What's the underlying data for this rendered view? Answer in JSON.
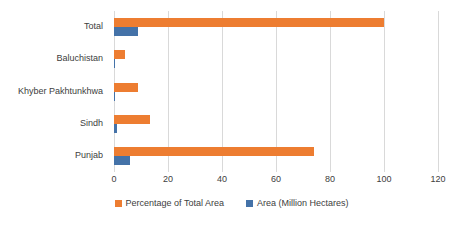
{
  "chart_data": {
    "type": "bar",
    "orientation": "horizontal",
    "title": "",
    "xlabel": "",
    "ylabel": "",
    "categories": [
      "Total",
      "Baluchistan",
      "Khyber Pakhtunkhwa",
      "Sindh",
      "Punjab"
    ],
    "series": [
      {
        "name": "Percentage of Total Area",
        "color": "#ED7D31",
        "values": [
          100,
          4,
          9,
          13.5,
          74
        ]
      },
      {
        "name": "Area (Million Hectares)",
        "color": "#4472A8",
        "values": [
          8.8,
          0.2,
          0.5,
          1,
          6
        ]
      }
    ],
    "xlim": [
      0,
      120
    ],
    "xticks": [
      0,
      20,
      40,
      60,
      80,
      100,
      120
    ],
    "xtick_labels": [
      "0",
      "20",
      "40",
      "60",
      "80",
      "100",
      "120"
    ],
    "grid": "vertical",
    "gridline_color": "#D9D9D9",
    "legend_position": "bottom",
    "legend": [
      "Percentage of Total Area",
      "Area (Million Hectares)"
    ]
  },
  "axis": {
    "categories": [
      {
        "label": "Total"
      },
      {
        "label": "Baluchistan"
      },
      {
        "label": "Khyber Pakhtunkhwa"
      },
      {
        "label": "Sindh"
      },
      {
        "label": "Punjab"
      }
    ],
    "ticks": [
      {
        "label": "0"
      },
      {
        "label": "20"
      },
      {
        "label": "40"
      },
      {
        "label": "60"
      },
      {
        "label": "80"
      },
      {
        "label": "100"
      },
      {
        "label": "120"
      }
    ]
  },
  "legend": {
    "items": [
      {
        "label": "Percentage of Total Area"
      },
      {
        "label": "Area (Million Hectares)"
      }
    ]
  }
}
